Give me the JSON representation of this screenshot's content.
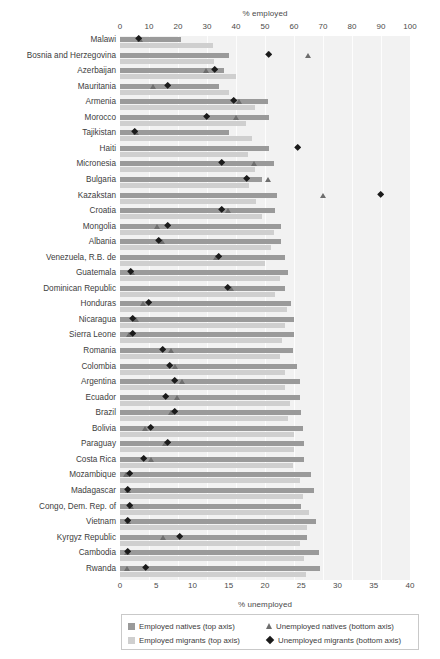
{
  "chart_data": {
    "type": "bar",
    "title": "",
    "subtitle": "",
    "orientation": "horizontal",
    "top_axis": {
      "label": "% employed",
      "ticks": [
        0,
        10,
        20,
        30,
        40,
        50,
        60,
        70,
        80,
        90,
        100
      ],
      "range": [
        0,
        100
      ]
    },
    "bottom_axis": {
      "label": "% unemployed",
      "ticks": [
        0,
        5,
        10,
        15,
        20,
        25,
        30,
        35,
        40
      ],
      "range": [
        0,
        40
      ]
    },
    "grid": true,
    "legend_position": "bottom",
    "legend": [
      {
        "key": "employed_natives",
        "label": "Employed natives (top axis)",
        "marker": "square-dark",
        "color": "#9a9a9a"
      },
      {
        "key": "unemployed_natives",
        "label": "Unemployed natives (bottom axis)",
        "marker": "triangle",
        "color": "#6e6e6e"
      },
      {
        "key": "employed_migrants",
        "label": "Employed migrants (top axis)",
        "marker": "square-light",
        "color": "#cfcfcf"
      },
      {
        "key": "unemployed_migrants",
        "label": "Unemployed migrants (bottom axis)",
        "marker": "diamond",
        "color": "#1b1b1b"
      }
    ],
    "categories": [
      "Malawi",
      "Bosnia and Herzegovina",
      "Azerbaijan",
      "Mauritania",
      "Armenia",
      "Morocco",
      "Tajikistan",
      "Haiti",
      "Micronesia",
      "Bulgaria",
      "Kazakstan",
      "Croatia",
      "Mongolia",
      "Albania",
      "Venezuela, R.B. de",
      "Guatemala",
      "Dominican Republic",
      "Honduras",
      "Nicaragua",
      "Sierra Leone",
      "Romania",
      "Colombia",
      "Argentina",
      "Ecuador",
      "Brazil",
      "Bolivia",
      "Paraguay",
      "Costa Rica",
      "Mozambique",
      "Madagascar",
      "Congo, Dem. Rep. of",
      "Vietnam",
      "Kyrgyz Republic",
      "Cambodia",
      "Rwanda"
    ],
    "series": [
      {
        "name": "Employed natives (top axis)",
        "axis": "top",
        "type": "bar",
        "color": "#9a9a9a",
        "values": [
          21.0,
          37.5,
          36.0,
          34.0,
          51.0,
          51.5,
          37.5,
          51.5,
          53.0,
          49.0,
          54.0,
          53.5,
          55.5,
          55.5,
          57.0,
          58.0,
          57.0,
          59.0,
          60.0,
          60.0,
          59.5,
          61.0,
          62.0,
          62.0,
          62.5,
          63.0,
          63.5,
          63.5,
          66.0,
          67.0,
          62.5,
          67.5,
          64.5,
          68.5,
          69.0
        ]
      },
      {
        "name": "Employed migrants (top axis)",
        "axis": "top",
        "type": "bar",
        "color": "#cfcfcf",
        "values": [
          32.0,
          32.5,
          40.0,
          37.5,
          46.5,
          43.5,
          45.5,
          44.0,
          46.5,
          44.5,
          47.0,
          49.0,
          53.0,
          52.0,
          50.0,
          55.0,
          53.5,
          57.5,
          57.0,
          56.0,
          55.0,
          57.0,
          57.0,
          58.5,
          58.0,
          60.0,
          60.0,
          59.5,
          62.0,
          63.0,
          65.0,
          64.5,
          62.0,
          63.5,
          64.0
        ]
      },
      {
        "name": "Unemployed natives (bottom axis)",
        "axis": "bottom",
        "type": "scatter",
        "marker": "triangle",
        "color": "#6e6e6e",
        "values": [
          2.8,
          26.0,
          11.9,
          4.6,
          16.5,
          16.0,
          2.2,
          null,
          18.5,
          20.5,
          28.0,
          14.9,
          5.1,
          5.8,
          13.3,
          1.7,
          15.3,
          3.2,
          2.2,
          1.3,
          7.1,
          7.6,
          8.6,
          7.9,
          7.0,
          3.5,
          6.3,
          4.3,
          0.9,
          1.1,
          1.6,
          1.1,
          6.0,
          1.0,
          1.0
        ]
      },
      {
        "name": "Unemployed migrants (bottom axis)",
        "axis": "bottom",
        "type": "scatter",
        "marker": "diamond",
        "color": "#1b1b1b",
        "values": [
          2.6,
          20.5,
          13.1,
          6.6,
          15.7,
          12.0,
          2.0,
          24.5,
          14.0,
          17.5,
          36.0,
          14.0,
          6.6,
          5.3,
          13.6,
          1.5,
          14.9,
          3.9,
          1.7,
          1.8,
          5.9,
          6.9,
          7.5,
          6.3,
          7.6,
          4.3,
          6.6,
          3.2,
          1.4,
          1.0,
          1.4,
          1.0,
          8.3,
          1.1,
          3.5
        ]
      }
    ]
  },
  "axis_titles": {
    "top": "% employed",
    "bottom": "% unemployed"
  }
}
